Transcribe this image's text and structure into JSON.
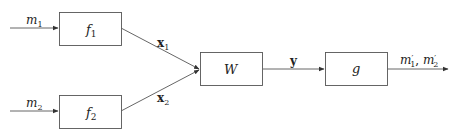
{
  "diagram": {
    "inputs": [
      {
        "id": "m1",
        "base": "m",
        "sub": "1"
      },
      {
        "id": "m2",
        "base": "m",
        "sub": "2"
      }
    ],
    "blocks": [
      {
        "id": "f1",
        "base": "f",
        "sub": "1"
      },
      {
        "id": "f2",
        "base": "f",
        "sub": "2"
      },
      {
        "id": "W",
        "base": "W",
        "sub": ""
      },
      {
        "id": "g",
        "base": "g",
        "sub": ""
      }
    ],
    "edges": [
      {
        "from": "m1",
        "to": "f1",
        "base": "m",
        "sub": "1"
      },
      {
        "from": "m2",
        "to": "f2",
        "base": "m",
        "sub": "2"
      },
      {
        "from": "f1",
        "to": "W",
        "base": "x",
        "sub": "1"
      },
      {
        "from": "f2",
        "to": "W",
        "base": "x",
        "sub": "2"
      },
      {
        "from": "W",
        "to": "g",
        "base": "y",
        "sub": ""
      },
      {
        "from": "g",
        "to": "output",
        "label": "m′1, m′2"
      }
    ],
    "labels": {
      "m1_base": "m",
      "m1_sub": "1",
      "m2_base": "m",
      "m2_sub": "2",
      "f1_base": "f",
      "f1_sub": "1",
      "f2_base": "f",
      "f2_sub": "2",
      "x1_base": "x",
      "x1_sub": "1",
      "x2_base": "x",
      "x2_sub": "2",
      "W": "W",
      "y": "y",
      "g": "g",
      "out_a_base": "m",
      "out_a_prime": "′",
      "out_a_sub": "1",
      "out_sep": ", ",
      "out_b_base": "m",
      "out_b_prime": "′",
      "out_b_sub": "2"
    },
    "colors": {
      "stroke": "#555555",
      "text": "#222222"
    }
  }
}
